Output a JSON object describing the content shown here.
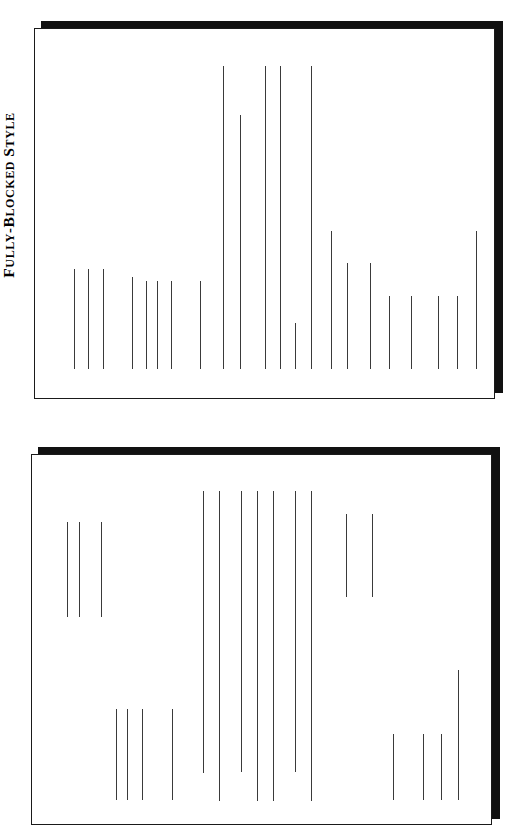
{
  "figure": {
    "orientation": "rotated-90",
    "panels": [
      {
        "id": "fully-blocked",
        "caption": "Fully-Blocked Style",
        "caption_parts": {
          "word1": "F",
          "rest1": "ULLY-",
          "word2": "B",
          "rest2": "LOCKED",
          "word3": "S",
          "rest3": "TYLE"
        },
        "description": "All letter elements flush to the left margin; every text line starts at the same left edge."
      },
      {
        "id": "semi-blocked",
        "caption": "Semi-Blocked Style",
        "caption_parts": {
          "word1": "S",
          "rest1": "EMI-",
          "word2": "B",
          "rest2": "LOCKED",
          "word3": "S",
          "rest3": "TYLE"
        },
        "description": "Date, closing and signature are indented to the right; paragraph first lines are indented."
      }
    ]
  },
  "chart_data": {
    "type": "diagram-lines",
    "note": "Each value is one text line of a letter. The page is rotated 90 degrees, so text lines render as vertical strokes. x = distance across the sheet; start/end = extent of the line.",
    "panels": [
      {
        "name": "Fully-Blocked Style",
        "sheet": {
          "x": 34,
          "y": 28,
          "width": 461,
          "height": 371
        },
        "shadow_offset": 7,
        "baseline_end": 368,
        "lines": [
          {
            "x": 73,
            "start": 268,
            "end": 368
          },
          {
            "x": 87,
            "start": 268,
            "end": 368
          },
          {
            "x": 102,
            "start": 268,
            "end": 368
          },
          {
            "x": 131,
            "start": 276,
            "end": 368
          },
          {
            "x": 145,
            "start": 280,
            "end": 368
          },
          {
            "x": 156,
            "start": 280,
            "end": 368
          },
          {
            "x": 170,
            "start": 280,
            "end": 368
          },
          {
            "x": 199,
            "start": 280,
            "end": 368
          },
          {
            "x": 222,
            "start": 65,
            "end": 368
          },
          {
            "x": 239,
            "start": 114,
            "end": 368
          },
          {
            "x": 264,
            "start": 65,
            "end": 368
          },
          {
            "x": 279,
            "start": 65,
            "end": 368
          },
          {
            "x": 294,
            "start": 322,
            "end": 368
          },
          {
            "x": 310,
            "start": 65,
            "end": 368
          },
          {
            "x": 330,
            "start": 230,
            "end": 368
          },
          {
            "x": 346,
            "start": 262,
            "end": 368
          },
          {
            "x": 369,
            "start": 262,
            "end": 368
          },
          {
            "x": 388,
            "start": 295,
            "end": 368
          },
          {
            "x": 410,
            "start": 295,
            "end": 368
          },
          {
            "x": 437,
            "start": 295,
            "end": 368
          },
          {
            "x": 456,
            "start": 295,
            "end": 368
          },
          {
            "x": 475,
            "start": 230,
            "end": 368
          }
        ]
      },
      {
        "name": "Semi-Blocked Style",
        "sheet": {
          "x": 31,
          "y": 454,
          "width": 461,
          "height": 371
        },
        "shadow_offset": 7,
        "lines": [
          {
            "x": 66,
            "start": 521,
            "end": 616
          },
          {
            "x": 78,
            "start": 521,
            "end": 616
          },
          {
            "x": 100,
            "start": 521,
            "end": 616
          },
          {
            "x": 115,
            "start": 708,
            "end": 799
          },
          {
            "x": 126,
            "start": 708,
            "end": 799
          },
          {
            "x": 141,
            "start": 708,
            "end": 799
          },
          {
            "x": 171,
            "start": 708,
            "end": 799
          },
          {
            "x": 202,
            "start": 490,
            "end": 772
          },
          {
            "x": 218,
            "start": 490,
            "end": 800
          },
          {
            "x": 240,
            "start": 490,
            "end": 771
          },
          {
            "x": 256,
            "start": 490,
            "end": 800
          },
          {
            "x": 272,
            "start": 490,
            "end": 800
          },
          {
            "x": 294,
            "start": 490,
            "end": 771
          },
          {
            "x": 310,
            "start": 490,
            "end": 800
          },
          {
            "x": 345,
            "start": 513,
            "end": 596
          },
          {
            "x": 371,
            "start": 513,
            "end": 596
          },
          {
            "x": 392,
            "start": 733,
            "end": 799
          },
          {
            "x": 422,
            "start": 733,
            "end": 799
          },
          {
            "x": 440,
            "start": 733,
            "end": 799
          },
          {
            "x": 457,
            "start": 669,
            "end": 799
          }
        ]
      }
    ],
    "colors": {
      "line": "#3a3a3a",
      "sheet_border": "#1a1a1a",
      "shadow": "#111111",
      "background": "#ffffff",
      "caption_text": "#000000"
    }
  }
}
